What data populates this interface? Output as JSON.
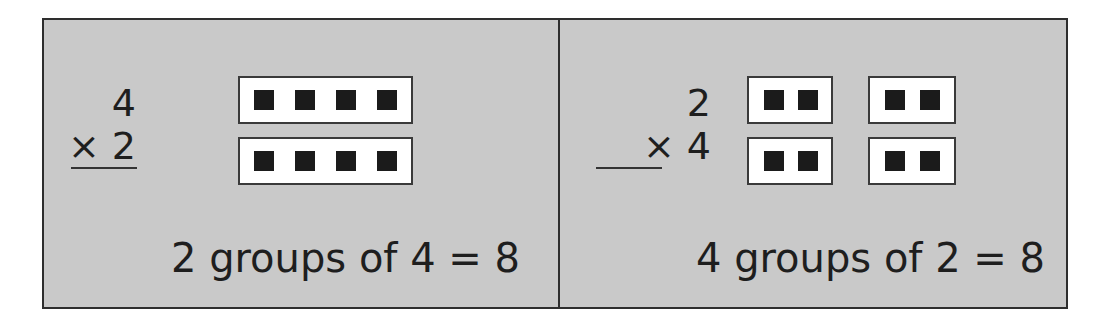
{
  "panels": [
    {
      "multiplicand": "4",
      "multiplier_line": "× 2",
      "groups": 2,
      "items_per_group": 4,
      "caption": "2 groups of 4 = 8"
    },
    {
      "multiplicand": "2",
      "multiplier_line": "× 4",
      "groups": 4,
      "items_per_group": 2,
      "caption": "4 groups of 2 = 8"
    }
  ],
  "colors": {
    "background": "#c9c9c9",
    "group_box": "#ffffff",
    "square": "#1b1b1b",
    "border": "#2e2e2e"
  }
}
